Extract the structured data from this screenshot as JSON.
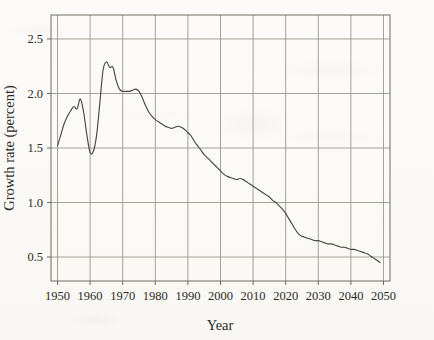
{
  "chart_data": {
    "type": "line",
    "title": "",
    "xlabel": "Year",
    "ylabel": "Growth rate (percent)",
    "xlim": [
      1948,
      2052
    ],
    "ylim": [
      0.28,
      2.72
    ],
    "grid": true,
    "legend_position": "none",
    "xticks": [
      1950,
      1960,
      1970,
      1980,
      1990,
      2000,
      2010,
      2020,
      2030,
      2040,
      2050
    ],
    "xtick_labels": [
      "1950",
      "1960",
      "1970",
      "1980",
      "1990",
      "2000",
      "2010",
      "2020",
      "2030",
      "2040",
      "2050"
    ],
    "yticks": [
      0.5,
      1.0,
      1.5,
      2.0,
      2.5
    ],
    "ytick_labels": [
      "0.5",
      "1.0",
      "1.5",
      "2.0",
      "2.5"
    ],
    "series": [
      {
        "name": "World population growth rate",
        "color": "#4a4641",
        "x": [
          1950,
          1951,
          1952,
          1953,
          1954,
          1955,
          1956,
          1957,
          1958,
          1959,
          1960,
          1961,
          1962,
          1963,
          1964,
          1965,
          1966,
          1967,
          1968,
          1969,
          1970,
          1971,
          1972,
          1973,
          1974,
          1975,
          1976,
          1977,
          1978,
          1979,
          1980,
          1981,
          1982,
          1983,
          1984,
          1985,
          1986,
          1987,
          1988,
          1989,
          1990,
          1991,
          1992,
          1993,
          1994,
          1995,
          1996,
          1997,
          1998,
          1999,
          2000,
          2001,
          2002,
          2003,
          2004,
          2005,
          2006,
          2007,
          2008,
          2009,
          2010,
          2011,
          2012,
          2013,
          2014,
          2015,
          2016,
          2017,
          2018,
          2019,
          2020,
          2021,
          2022,
          2023,
          2024,
          2025,
          2026,
          2027,
          2028,
          2029,
          2030,
          2031,
          2032,
          2033,
          2034,
          2035,
          2036,
          2037,
          2038,
          2039,
          2040,
          2041,
          2042,
          2043,
          2044,
          2045,
          2046,
          2047,
          2048,
          2049
        ],
        "y": [
          1.52,
          1.62,
          1.72,
          1.79,
          1.84,
          1.88,
          1.86,
          1.95,
          1.83,
          1.62,
          1.46,
          1.47,
          1.62,
          1.92,
          2.22,
          2.29,
          2.24,
          2.24,
          2.12,
          2.04,
          2.02,
          2.02,
          2.02,
          2.03,
          2.04,
          2.02,
          1.96,
          1.89,
          1.83,
          1.79,
          1.76,
          1.74,
          1.72,
          1.7,
          1.69,
          1.68,
          1.69,
          1.7,
          1.69,
          1.67,
          1.64,
          1.61,
          1.56,
          1.52,
          1.48,
          1.44,
          1.41,
          1.38,
          1.35,
          1.32,
          1.29,
          1.26,
          1.24,
          1.23,
          1.22,
          1.21,
          1.22,
          1.21,
          1.19,
          1.17,
          1.15,
          1.13,
          1.11,
          1.09,
          1.07,
          1.05,
          1.02,
          1.0,
          0.97,
          0.94,
          0.9,
          0.85,
          0.8,
          0.75,
          0.71,
          0.69,
          0.68,
          0.67,
          0.66,
          0.65,
          0.65,
          0.64,
          0.63,
          0.62,
          0.62,
          0.61,
          0.6,
          0.59,
          0.59,
          0.58,
          0.57,
          0.57,
          0.56,
          0.55,
          0.54,
          0.53,
          0.51,
          0.49,
          0.47,
          0.45
        ]
      }
    ],
    "annotations": []
  }
}
